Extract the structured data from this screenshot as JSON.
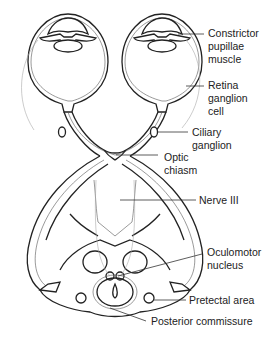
{
  "diagram": {
    "structures": [
      "left eye",
      "right eye",
      "optic nerves",
      "optic chiasm",
      "optic tracts",
      "midbrain cross-section"
    ],
    "labels": [
      {
        "id": "constrictor",
        "lines": [
          "Constrictor",
          "pupillae",
          "muscle"
        ]
      },
      {
        "id": "retina",
        "lines": [
          "Retina",
          "ganglion",
          "cell"
        ]
      },
      {
        "id": "ciliary",
        "lines": [
          "Ciliary",
          "ganglion"
        ]
      },
      {
        "id": "chiasm",
        "lines": [
          "Optic",
          "chiasm"
        ]
      },
      {
        "id": "nerve3",
        "lines": [
          "Nerve III"
        ]
      },
      {
        "id": "oculomotor",
        "lines": [
          "Oculomotor",
          "nucleus"
        ]
      },
      {
        "id": "pretectal",
        "lines": [
          "Pretectal area"
        ]
      },
      {
        "id": "commissure",
        "lines": [
          "Posterior commissure"
        ]
      }
    ],
    "colors": {
      "line": "#222222",
      "background": "#ffffff",
      "faint": "#aaaaaa"
    }
  }
}
